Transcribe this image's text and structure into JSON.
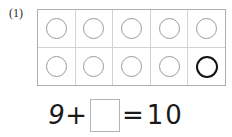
{
  "problem": {
    "number_label": "(1)",
    "type": "ten-frame-addition"
  },
  "ten_frame": {
    "columns": 5,
    "rows": 2,
    "total_cells": 10,
    "filled_counters": 9,
    "colors": {
      "frame_border": "#aeaeae",
      "cell_divider": "#d2d2d2",
      "counter_gray": "#9a9a9a",
      "counter_dark": "#121212",
      "background": "#ffffff"
    },
    "cells": [
      {
        "row": 1,
        "col": 1,
        "counter": "circle",
        "style": "gray"
      },
      {
        "row": 1,
        "col": 2,
        "counter": "circle",
        "style": "gray"
      },
      {
        "row": 1,
        "col": 3,
        "counter": "circle",
        "style": "gray"
      },
      {
        "row": 1,
        "col": 4,
        "counter": "circle",
        "style": "gray"
      },
      {
        "row": 1,
        "col": 5,
        "counter": "circle",
        "style": "gray"
      },
      {
        "row": 2,
        "col": 1,
        "counter": "circle",
        "style": "gray"
      },
      {
        "row": 2,
        "col": 2,
        "counter": "circle",
        "style": "gray"
      },
      {
        "row": 2,
        "col": 3,
        "counter": "circle",
        "style": "gray"
      },
      {
        "row": 2,
        "col": 4,
        "counter": "circle",
        "style": "gray"
      },
      {
        "row": 2,
        "col": 5,
        "counter": "circle",
        "style": "dark"
      }
    ]
  },
  "equation": {
    "left_operand": "9",
    "operator": "+",
    "answer_value": "",
    "answer_placeholder": "",
    "equals_sign": "=",
    "right_operand": "10"
  }
}
